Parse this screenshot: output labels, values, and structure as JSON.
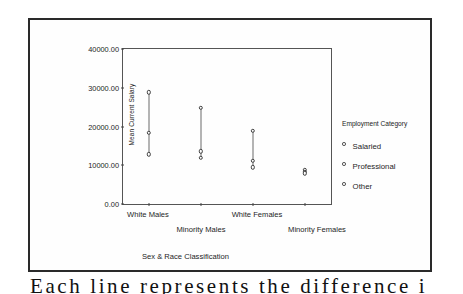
{
  "chart_data": {
    "type": "scatter",
    "title": "",
    "xlabel": "Sex & Race Classification",
    "ylabel": "Mean Current Salary",
    "categories": [
      "White Males",
      "Minority Males",
      "White Females",
      "Minority Females"
    ],
    "ytick_labels": [
      "40000.00",
      "30000.00",
      "20000.00",
      "10000.00",
      "0.00"
    ],
    "ytick_values": [
      40000,
      30000,
      20000,
      10000,
      0
    ],
    "ylim": [
      0,
      40000
    ],
    "grid": false,
    "legend_position": "right",
    "legend_title": "Employment Category",
    "series": [
      {
        "name": "Salaried",
        "marker": "open-circle",
        "values": [
          28800,
          24900,
          18900,
          8900
        ]
      },
      {
        "name": "Professional",
        "marker": "open-circle",
        "values": [
          18300,
          13600,
          11200,
          8300
        ]
      },
      {
        "name": "Other",
        "marker": "open-circle",
        "values": [
          12800,
          11900,
          9500,
          7900
        ]
      }
    ],
    "annotations": [
      "Lines connect the employment-category means within each sex & race group."
    ]
  },
  "figure": {
    "y_axis_title": "Mean Current Salary",
    "x_axis_title": "Sex & Race Classification",
    "legend": {
      "title": "Employment Category",
      "items": [
        {
          "label": "Salaried"
        },
        {
          "label": "Professional"
        },
        {
          "label": "Other"
        }
      ]
    },
    "x_labels": [
      {
        "text": "White Males"
      },
      {
        "text": "Minority Males"
      },
      {
        "text": "White Females"
      },
      {
        "text": "Minority Females"
      }
    ],
    "y_labels": [
      {
        "text": "40000.00"
      },
      {
        "text": "30000.00"
      },
      {
        "text": "20000.00"
      },
      {
        "text": "10000.00"
      },
      {
        "text": "0.00"
      }
    ]
  },
  "page": {
    "caption_fragment": "Each line represents the difference i"
  }
}
